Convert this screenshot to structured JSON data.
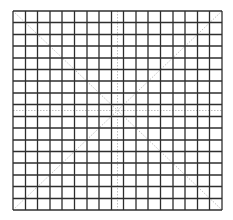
{
  "canvas": {
    "width": 233,
    "height": 220,
    "background": "#ffffff"
  },
  "grid": {
    "left": 13,
    "top": 11,
    "right": 222,
    "bottom": 210,
    "columns": 17,
    "rows": 17,
    "line_color": "#2e2e2e",
    "line_width": 1.3
  },
  "guides": {
    "color": "#b8b8b8",
    "width": 0.9,
    "dash": "1.5,1.5",
    "lines": [
      "diagonal-main",
      "diagonal-anti",
      "center-vertical",
      "center-horizontal"
    ]
  }
}
